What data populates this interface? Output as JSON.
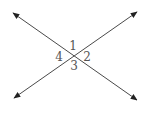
{
  "diagram": {
    "type": "intersecting-lines",
    "line_color": "#4a4a4a",
    "label_color": "#555555",
    "intersection": [
      73,
      56
    ],
    "lines": [
      {
        "name": "line-a",
        "from": [
          13,
          13
        ],
        "to": [
          137,
          100
        ]
      },
      {
        "name": "line-b",
        "from": [
          14,
          98
        ],
        "to": [
          137,
          12
        ]
      }
    ],
    "angle_labels": [
      {
        "id": "1",
        "text": "1",
        "x": 73,
        "y": 50
      },
      {
        "id": "2",
        "text": "2",
        "x": 87,
        "y": 61
      },
      {
        "id": "3",
        "text": "3",
        "x": 74,
        "y": 70
      },
      {
        "id": "4",
        "text": "4",
        "x": 59,
        "y": 61
      }
    ]
  }
}
